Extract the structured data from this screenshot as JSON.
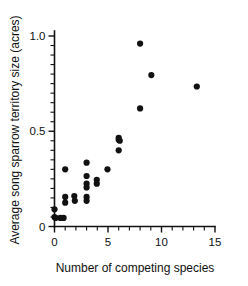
{
  "chart_data": {
    "type": "scatter",
    "title": "",
    "xlabel": "Number of competing species",
    "ylabel": "Average song sparrow territory size (acres)",
    "xlim": [
      0,
      15
    ],
    "ylim": [
      0,
      1.05
    ],
    "x_ticks": [
      0,
      5,
      10,
      15
    ],
    "x_tick_labels": [
      "0",
      "5",
      "10",
      "15"
    ],
    "x_minor_step": 1,
    "y_ticks": [
      0,
      0.5,
      1.0
    ],
    "y_tick_labels": [
      "0",
      "0.5",
      "1.0"
    ],
    "y_minor_step": 0.05,
    "grid": false,
    "legend": "none",
    "marker": "filled-circle",
    "marker_color": "#111111",
    "points": [
      {
        "x": 0.0,
        "y": 0.09
      },
      {
        "x": 0.0,
        "y": 0.05
      },
      {
        "x": 0.1,
        "y": 0.045
      },
      {
        "x": 0.55,
        "y": 0.045
      },
      {
        "x": 0.85,
        "y": 0.045
      },
      {
        "x": 1.0,
        "y": 0.3
      },
      {
        "x": 1.0,
        "y": 0.155
      },
      {
        "x": 1.0,
        "y": 0.125
      },
      {
        "x": 1.85,
        "y": 0.16
      },
      {
        "x": 1.9,
        "y": 0.135
      },
      {
        "x": 3.0,
        "y": 0.335
      },
      {
        "x": 3.0,
        "y": 0.265
      },
      {
        "x": 3.0,
        "y": 0.225
      },
      {
        "x": 3.0,
        "y": 0.205
      },
      {
        "x": 3.0,
        "y": 0.155
      },
      {
        "x": 3.0,
        "y": 0.135
      },
      {
        "x": 3.95,
        "y": 0.245
      },
      {
        "x": 3.95,
        "y": 0.225
      },
      {
        "x": 4.95,
        "y": 0.3
      },
      {
        "x": 6.0,
        "y": 0.465
      },
      {
        "x": 6.0,
        "y": 0.455
      },
      {
        "x": 6.1,
        "y": 0.45
      },
      {
        "x": 6.0,
        "y": 0.4
      },
      {
        "x": 8.0,
        "y": 0.96
      },
      {
        "x": 8.0,
        "y": 0.62
      },
      {
        "x": 9.05,
        "y": 0.795
      },
      {
        "x": 13.3,
        "y": 0.735
      }
    ]
  }
}
